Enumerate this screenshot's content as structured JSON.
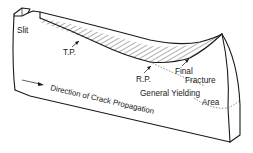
{
  "figure": {
    "labels": {
      "slit": "Slit",
      "tp": "T.P.",
      "rp": "R.P.",
      "final_fracture_line1": "Final",
      "final_fracture_line2": "Fracture",
      "general_yielding_line1": "General Yielding",
      "general_yielding_line2": "Area",
      "direction": "Direction of Crack Propagation"
    },
    "colors": {
      "line": "#1a1a1a",
      "background": "#ffffff"
    }
  }
}
